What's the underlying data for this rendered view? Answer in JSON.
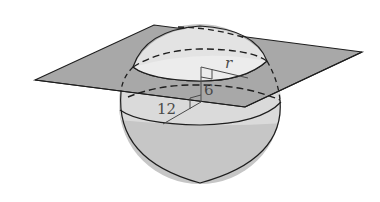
{
  "figure": {
    "labels": {
      "radius_section": "r",
      "distance_to_plane": "6",
      "sphere_radius": "12"
    },
    "colors": {
      "plane_fill": "#a9a9a9",
      "sphere_fill": "#c9c9c9",
      "cap_fill": "#e6e6e6",
      "section_fill": "#ececec",
      "stroke": "#1e1e1e",
      "label": "#4a4a4a"
    }
  }
}
